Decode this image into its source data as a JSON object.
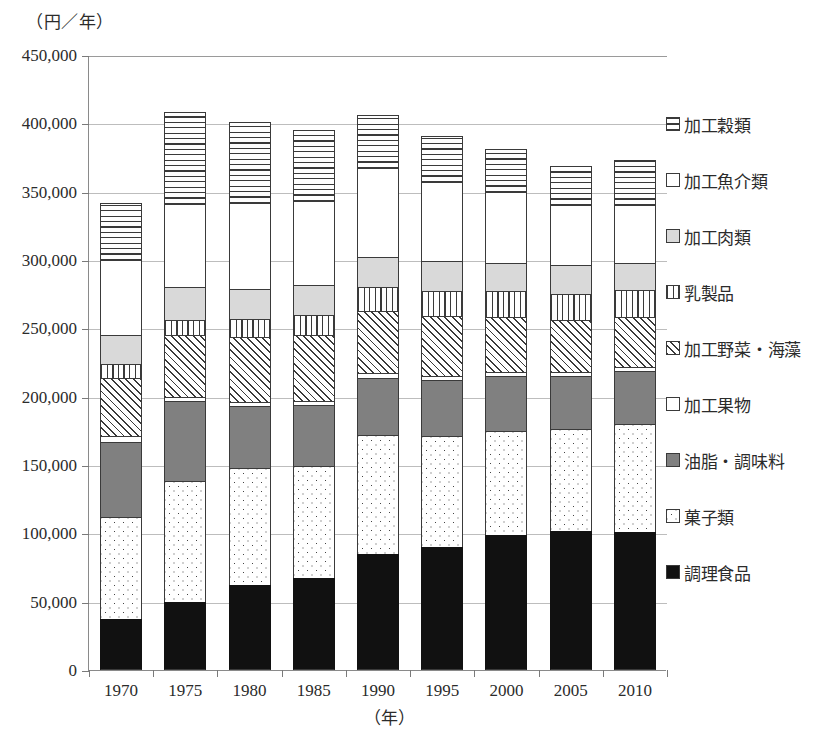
{
  "axes": {
    "y_unit_label": "（円／年）",
    "x_unit_label": "（年）",
    "y_ticks": [
      "450,000",
      "400,000",
      "350,000",
      "300,000",
      "250,000",
      "200,000",
      "150,000",
      "100,000",
      "50,000",
      "0"
    ],
    "x_ticks": [
      "1970",
      "1975",
      "1980",
      "1985",
      "1990",
      "1995",
      "2000",
      "2005",
      "2010"
    ]
  },
  "legend": {
    "items": [
      {
        "label": "加工穀類",
        "pattern": "horizontal-hatch",
        "key": "kakou_kokurui"
      },
      {
        "label": "加工魚介類",
        "pattern": "white",
        "key": "kakou_gyokairui"
      },
      {
        "label": "加工肉類",
        "pattern": "light-gray",
        "key": "kakou_nikurui"
      },
      {
        "label": "乳製品",
        "pattern": "vertical-hatch",
        "key": "nyuseihin"
      },
      {
        "label": "加工野菜・海藻",
        "pattern": "diagonal-hatch",
        "key": "kakou_yasai_kaisou"
      },
      {
        "label": "加工果物",
        "pattern": "white",
        "key": "kakou_kudamono"
      },
      {
        "label": "油脂・調味料",
        "pattern": "gray",
        "key": "yushi_chomiryo"
      },
      {
        "label": "菓子類",
        "pattern": "dots",
        "key": "kashirui"
      },
      {
        "label": "調理食品",
        "pattern": "solid-black",
        "key": "chori_shokuhin"
      }
    ]
  },
  "chart_data": {
    "type": "bar",
    "subtype": "stacked",
    "title": "",
    "xlabel": "（年）",
    "ylabel": "（円／年）",
    "ylim": [
      0,
      450000
    ],
    "ytick_step": 50000,
    "grid": true,
    "legend_position": "right",
    "categories": [
      "1970",
      "1975",
      "1980",
      "1985",
      "1990",
      "1995",
      "2000",
      "2005",
      "2010"
    ],
    "series": [
      {
        "name": "調理食品",
        "values": [
          37000,
          50000,
          62000,
          67000,
          85000,
          90000,
          99000,
          102000,
          101000
        ]
      },
      {
        "name": "菓子類",
        "values": [
          75000,
          88000,
          86000,
          82000,
          87000,
          81000,
          76000,
          74000,
          79000
        ]
      },
      {
        "name": "油脂・調味料",
        "values": [
          55000,
          59000,
          45000,
          45000,
          42000,
          41000,
          40000,
          39000,
          39000
        ]
      },
      {
        "name": "加工果物",
        "values": [
          4000,
          3000,
          3000,
          3000,
          3000,
          3000,
          3000,
          3000,
          3000
        ]
      },
      {
        "name": "加工野菜・海藻",
        "values": [
          43000,
          45000,
          48000,
          48000,
          46000,
          44000,
          40000,
          38000,
          36000
        ]
      },
      {
        "name": "乳製品",
        "values": [
          10000,
          11000,
          13000,
          15000,
          17000,
          18000,
          19000,
          19000,
          20000
        ]
      },
      {
        "name": "加工肉類",
        "values": [
          21000,
          24000,
          22000,
          22000,
          22000,
          22000,
          21000,
          21000,
          20000
        ]
      },
      {
        "name": "加工魚介類",
        "values": [
          55000,
          61000,
          63000,
          61000,
          65000,
          58000,
          52000,
          44000,
          42000
        ]
      },
      {
        "name": "加工穀類",
        "values": [
          42000,
          67000,
          59000,
          52000,
          39000,
          34000,
          31000,
          29000,
          33000
        ]
      }
    ],
    "totals": [
      342000,
      408000,
      401000,
      395000,
      406000,
      391000,
      381000,
      369000,
      373000
    ]
  }
}
